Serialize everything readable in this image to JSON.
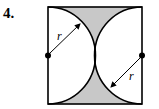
{
  "problem": {
    "number": "4.",
    "label_top": "r",
    "label_bottom": "r"
  },
  "colors": {
    "shade": "#c8c8c8",
    "stroke": "#000000"
  }
}
